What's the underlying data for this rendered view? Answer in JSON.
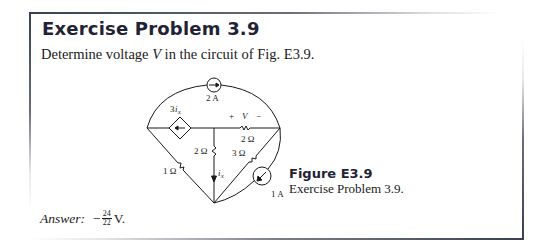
{
  "header": {
    "title": "Exercise Problem 3.9"
  },
  "prompt": {
    "before": "Determine voltage ",
    "variable": "V",
    "after": " in the circuit of Fig. E3.9."
  },
  "figure": {
    "label": "Figure E3.9",
    "caption": "Exercise Problem 3.9.",
    "components": {
      "current_source_top": "2 A",
      "dependent_source_label_coef": "3",
      "dependent_source_label_var": "i",
      "dependent_source_label_sub": "x",
      "voltage_plus": "+",
      "voltage_var": "V",
      "voltage_minus": "−",
      "resistor_top": "2 Ω",
      "resistor_middle": "2 Ω",
      "resistor_diagonal_right": "3 Ω",
      "resistor_diagonal_left": "1 Ω",
      "current_label_var": "i",
      "current_label_sub": "x",
      "current_source_bottom": "1 A"
    },
    "icons": {
      "current_source_top": "current-source-arrow-right",
      "dependent_source": "dependent-current-source-arrow-left",
      "current_source_bottom": "current-source-arrow-down-left"
    }
  },
  "answer": {
    "label": "Answer:",
    "sign": "−",
    "numerator": "24",
    "denominator": "22",
    "unit": "V."
  },
  "colors": {
    "title": "#1f2335",
    "border": "#3a3f52",
    "text": "#1a1a1a"
  }
}
